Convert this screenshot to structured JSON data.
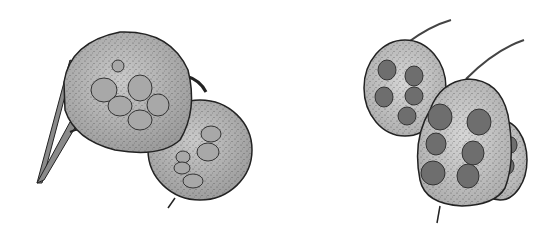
{
  "illustration": {
    "subject": "seed pods",
    "left_group": {
      "pod_count": 2,
      "seed_color": "#a8a8a8",
      "pod_color": "#b8b8b8"
    },
    "right_group": {
      "pod_count": 3,
      "seed_color": "#6e6e6e",
      "pod_color": "#c4c4c4"
    },
    "outline_color": "#222222",
    "background": "#ffffff"
  }
}
